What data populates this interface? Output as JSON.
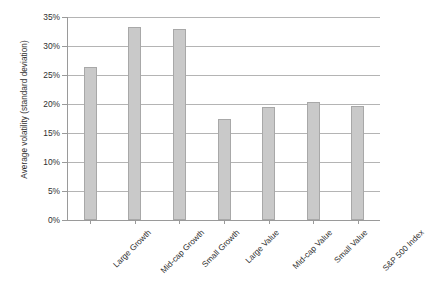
{
  "chart_data": {
    "type": "bar",
    "title": "Average volatility by style category",
    "categories": [
      "Large Growth",
      "Mid-cap Growth",
      "Small Growth",
      "Large Value",
      "Mid-cap Value",
      "Small Value",
      "S&P 500 Index"
    ],
    "values": [
      26.4,
      33.2,
      33.0,
      17.4,
      19.5,
      20.3,
      19.7
    ],
    "value_labels": [
      "26.4%",
      "33.2%",
      "33.0%",
      "17.4%",
      "19.5%",
      "20.3%",
      "19.7%"
    ],
    "xlabel": "",
    "ylabel": "Average volatility (standard deviation)",
    "ylim": [
      0,
      35
    ],
    "ytick_values": [
      0,
      5,
      10,
      15,
      20,
      25,
      30,
      35
    ],
    "ytick_labels": [
      "0%",
      "5%",
      "10%",
      "15%",
      "20%",
      "25%",
      "30%",
      "35%"
    ],
    "grid": true,
    "grid_axis": "y",
    "legend": false,
    "legend_position": "none",
    "bar_color": "#c9c9c9",
    "bar_border_color": "#a8a8a8",
    "gridline_color": "#b4b4b4",
    "axis_color": "#9a9a9a",
    "background_color": "#ffffff",
    "text_color": "#2f2f2f",
    "label_rotation": -45
  }
}
